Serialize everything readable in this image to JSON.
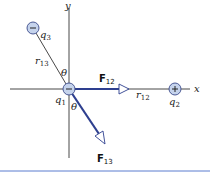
{
  "diagram": {
    "axes": {
      "x_label": "x",
      "y_label": "y"
    },
    "charges": [
      {
        "id": "q1",
        "name": "q",
        "sub": "1",
        "sign": "−",
        "position": "origin"
      },
      {
        "id": "q2",
        "name": "q",
        "sub": "2",
        "sign": "+",
        "position": "positive x-axis"
      },
      {
        "id": "q3",
        "name": "q",
        "sub": "3",
        "sign": "−",
        "position": "upper-left quadrant"
      }
    ],
    "distances": [
      {
        "id": "r12",
        "name": "r",
        "sub": "12"
      },
      {
        "id": "r13",
        "name": "r",
        "sub": "13"
      }
    ],
    "forces": [
      {
        "id": "F12",
        "name": "F",
        "sub": "12",
        "direction": "toward q2 (+x)"
      },
      {
        "id": "F13",
        "name": "F",
        "sub": "13",
        "direction": "away from q3"
      }
    ],
    "angles": [
      {
        "id": "theta-upper",
        "symbol": "θ"
      },
      {
        "id": "theta-lower",
        "symbol": "θ"
      }
    ],
    "colors": {
      "axis": "#333333",
      "force_vector": "#2e3f8f",
      "charge_fill": "#c5d3ec",
      "charge_stroke": "#3a4a8a",
      "rule": "#5a7ccf"
    }
  }
}
